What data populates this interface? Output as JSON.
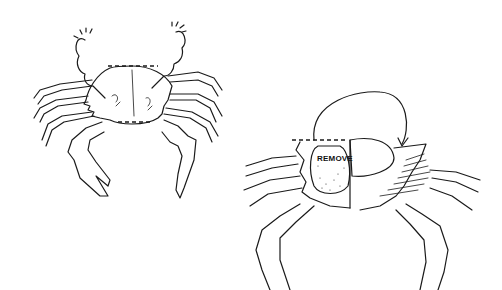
{
  "figure": {
    "left_panel": {
      "subject": "whole crab, dorsal view",
      "annotation": "dashed outline marking carapace edge"
    },
    "right_panel": {
      "subject": "crab with carapace flipped back",
      "label": "REMOVE",
      "annotation": "curved arrow indicating carapace lift-and-flip"
    }
  },
  "colors": {
    "ink": "#1a1a1a",
    "background": "#ffffff"
  }
}
